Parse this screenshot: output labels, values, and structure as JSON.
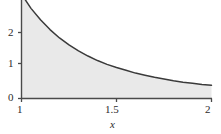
{
  "figure": {
    "background_color": "#ffffff",
    "axis_color": "#3a3a3a",
    "curve_color": "#3a3a3a",
    "fill_color": "#e8e8e8"
  },
  "chart_data": {
    "type": "area",
    "title": "",
    "subtitle": "",
    "xlabel": "x",
    "ylabel": "",
    "grid": false,
    "legend": null,
    "xlim": [
      1,
      2
    ],
    "ylim": [
      0,
      3
    ],
    "x_ticks": [
      1,
      1.5,
      2
    ],
    "x_tick_labels": [
      "1",
      "1.5",
      "2"
    ],
    "y_ticks": [
      0,
      1,
      2
    ],
    "y_tick_labels": [
      "0",
      "1",
      "2"
    ],
    "fill_from": 0,
    "series": [
      {
        "name": "curve",
        "x": [
          1.0,
          1.05,
          1.1,
          1.15,
          1.2,
          1.25,
          1.3,
          1.35,
          1.4,
          1.45,
          1.5,
          1.55,
          1.6,
          1.65,
          1.7,
          1.75,
          1.8,
          1.85,
          1.9,
          1.95,
          2.0
        ],
        "values": [
          3.0,
          2.59,
          2.26,
          1.98,
          1.74,
          1.54,
          1.37,
          1.22,
          1.09,
          0.98,
          0.89,
          0.81,
          0.73,
          0.67,
          0.61,
          0.56,
          0.51,
          0.47,
          0.44,
          0.4,
          0.38
        ]
      }
    ]
  },
  "labels": {
    "y2": "2",
    "y1": "1",
    "y0": "0",
    "x1": "1",
    "x15": "1.5",
    "x2": "2",
    "x_axis_title": "x"
  }
}
